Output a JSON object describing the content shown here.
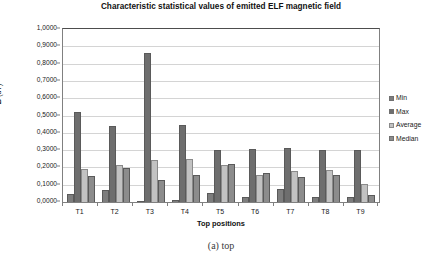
{
  "chart_data": {
    "type": "bar",
    "title": "Characteristic statistical values of emitted ELF magnetic field",
    "xlabel": "Top positions",
    "ylabel": "B (uT)",
    "ylim": [
      0,
      1.0
    ],
    "ytick_step": 0.1,
    "grid": true,
    "legend_position": "right",
    "decimal_separator": ",",
    "categories": [
      "T1",
      "T2",
      "T3",
      "T4",
      "T5",
      "T6",
      "T7",
      "T8",
      "T9"
    ],
    "ytick_labels": [
      "0,0000",
      "0,1000",
      "0,2000",
      "0,3000",
      "0,4000",
      "0,5000",
      "0,6000",
      "0,7000",
      "0,8000",
      "0,9000",
      "1,0000"
    ],
    "series": [
      {
        "name": "Min",
        "values": [
          0.045,
          0.071,
          0.005,
          0.012,
          0.05,
          0.027,
          0.078,
          0.03,
          0.027
        ]
      },
      {
        "name": "Max",
        "values": [
          0.518,
          0.44,
          0.86,
          0.443,
          0.3,
          0.305,
          0.31,
          0.3,
          0.298
        ]
      },
      {
        "name": "Average",
        "values": [
          0.192,
          0.213,
          0.24,
          0.248,
          0.216,
          0.155,
          0.182,
          0.185,
          0.105
        ]
      },
      {
        "name": "Median",
        "values": [
          0.148,
          0.196,
          0.13,
          0.155,
          0.22,
          0.168,
          0.147,
          0.158,
          0.04
        ]
      }
    ]
  },
  "caption": {
    "text": "(a) top"
  },
  "legend": {
    "items": [
      {
        "label": "Min"
      },
      {
        "label": "Max"
      },
      {
        "label": "Average"
      },
      {
        "label": "Median"
      }
    ]
  },
  "colors": {
    "min": "#7d7d7d",
    "max": "#6e6e6e",
    "average": "#c2c2c2",
    "median": "#8c8c8c",
    "grid": "#d4d4d4",
    "frame": "#808080",
    "text": "#1a1a1a"
  }
}
